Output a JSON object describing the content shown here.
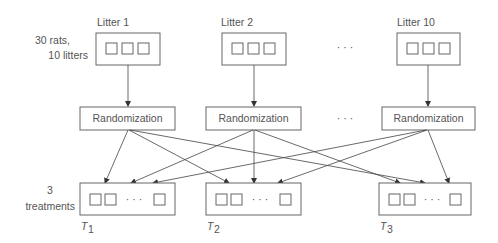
{
  "litters": [
    {
      "label": "Litter 1"
    },
    {
      "label": "Litter 2"
    },
    {
      "label": "Litter 10"
    }
  ],
  "left_labels": {
    "rats_line1": "30 rats,",
    "rats_line2": "10 litters",
    "treat_line1": "3",
    "treat_line2": "treatments"
  },
  "randomization": {
    "label": "Randomization"
  },
  "ellipsis": "· · ·",
  "treatments": [
    {
      "label": "T",
      "sub": "1"
    },
    {
      "label": "T",
      "sub": "2"
    },
    {
      "label": "T",
      "sub": "3"
    }
  ],
  "colors": {
    "line": "#444444",
    "box": "#666666",
    "text": "#555555"
  }
}
